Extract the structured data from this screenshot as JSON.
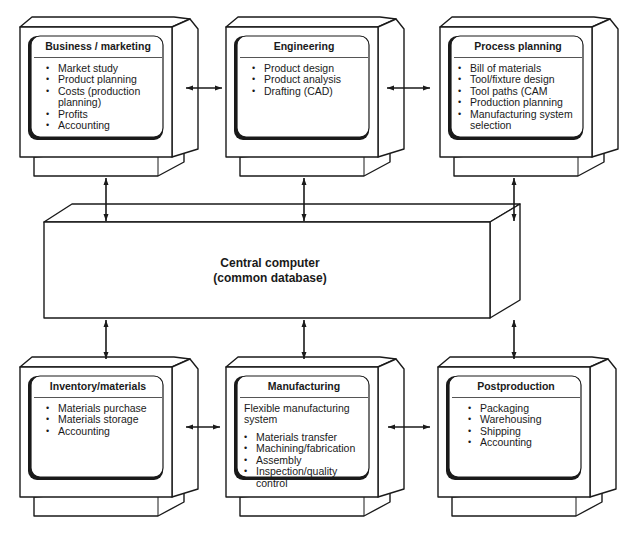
{
  "diagram": {
    "central": {
      "title": "Central computer",
      "subtitle": "(common database)"
    },
    "stations": [
      {
        "id": "business-marketing",
        "title": "Business / marketing",
        "intro": "",
        "items": [
          "Market study",
          "Product planning",
          "Costs (production planning)",
          "Profits",
          "Accounting"
        ]
      },
      {
        "id": "engineering",
        "title": "Engineering",
        "intro": "",
        "items": [
          "Product design",
          "Product analysis",
          "Drafting (CAD)"
        ]
      },
      {
        "id": "process-planning",
        "title": "Process planning",
        "intro": "",
        "items": [
          "Bill of materials",
          "Tool/fixture design",
          "Tool paths (CAM",
          "Production planning",
          "Manufacturing system selection"
        ]
      },
      {
        "id": "inventory-materials",
        "title": "Inventory/materials",
        "intro": "",
        "items": [
          "Materials purchase",
          "Materials storage",
          "Accounting"
        ]
      },
      {
        "id": "manufacturing",
        "title": "Manufacturing",
        "intro": "Flexible manufacturing system",
        "items": [
          "Materials transfer",
          "Machining/fabrication",
          "Assembly",
          "Inspection/quality control"
        ]
      },
      {
        "id": "postproduction",
        "title": "Postproduction",
        "intro": "",
        "items": [
          "Packaging",
          "Warehousing",
          "Shipping",
          "Accounting"
        ]
      }
    ],
    "connections": [
      {
        "from": "business-marketing",
        "to": "engineering",
        "type": "bidirectional"
      },
      {
        "from": "engineering",
        "to": "process-planning",
        "type": "bidirectional"
      },
      {
        "from": "inventory-materials",
        "to": "manufacturing",
        "type": "bidirectional"
      },
      {
        "from": "manufacturing",
        "to": "postproduction",
        "type": "bidirectional"
      },
      {
        "from": "business-marketing",
        "to": "central",
        "type": "bidirectional"
      },
      {
        "from": "engineering",
        "to": "central",
        "type": "bidirectional"
      },
      {
        "from": "process-planning",
        "to": "central",
        "type": "bidirectional"
      },
      {
        "from": "inventory-materials",
        "to": "central",
        "type": "bidirectional"
      },
      {
        "from": "manufacturing",
        "to": "central",
        "type": "bidirectional"
      },
      {
        "from": "postproduction",
        "to": "central",
        "type": "bidirectional"
      }
    ]
  }
}
